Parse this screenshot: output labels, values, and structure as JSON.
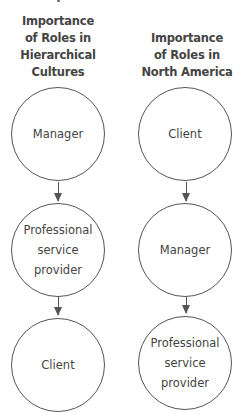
{
  "columns": [
    {
      "heading_lines": [
        "Importance",
        "of Roles in",
        "Hierarchical",
        "Cultures"
      ],
      "nodes": [
        {
          "lines": [
            "Manager"
          ]
        },
        {
          "lines": [
            "Professional",
            "service",
            "provider"
          ]
        },
        {
          "lines": [
            "Client"
          ]
        }
      ]
    },
    {
      "heading_lines": [
        "Importance",
        "of Roles in",
        "North America"
      ],
      "nodes": [
        {
          "lines": [
            "Client"
          ]
        },
        {
          "lines": [
            "Manager"
          ]
        },
        {
          "lines": [
            "Professional",
            "service",
            "provider"
          ]
        }
      ]
    }
  ],
  "colors": {
    "text": "#444444",
    "stroke": "#555555",
    "background": "#ffffff"
  }
}
